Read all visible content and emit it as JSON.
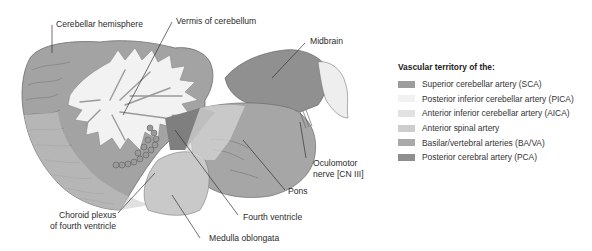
{
  "labels": {
    "cerebellar_hemisphere": "Cerebellar hemisphere",
    "vermis": "Vermis of cerebellum",
    "midbrain": "Midbrain",
    "oculomotor_line1": "Oculomotor",
    "oculomotor_line2": "nerve [CN III]",
    "pons": "Pons",
    "fourth_ventricle": "Fourth ventricle",
    "choroid_line1": "Choroid plexus",
    "choroid_line2": "of fourth ventricle",
    "medulla": "Medulla oblongata"
  },
  "legend": {
    "title": "Vascular territory of the:",
    "items": [
      {
        "label": "Superior cerebellar artery (SCA)",
        "color": "#9c9c9c"
      },
      {
        "label": "Posterior inferior cerebellar artery (PICA)",
        "color": "#f1f1f1"
      },
      {
        "label": "Anterior inferior cerebellar artery (AICA)",
        "color": "#e2e2e2"
      },
      {
        "label": "Anterior spinal artery",
        "color": "#cdcdcd"
      },
      {
        "label": "Basilar/vertebral arteries (BA/VA)",
        "color": "#a9a9a9"
      },
      {
        "label": "Posterior cerebral artery (PCA)",
        "color": "#8f8f8f"
      }
    ]
  }
}
